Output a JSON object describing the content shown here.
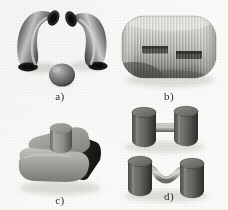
{
  "figure": {
    "background_color": "#fbfaf8",
    "style": "grayscale shaded 3D solid models (CAD render), 2x2 panel layout",
    "panels": [
      {
        "id": "a",
        "caption": "a)",
        "description": "Two mirrored 90-degree pipe elbows (torus bend segments) and one small ellipsoid / sphere below between them",
        "objects": [
          {
            "name": "pipe-elbow-left",
            "shape": "90-degree bent tube",
            "fill": "#5a5a5a",
            "highlight": "#c8c8c8",
            "shadow": "#1e1e1e"
          },
          {
            "name": "pipe-elbow-right",
            "shape": "90-degree bent tube mirrored",
            "fill": "#5a5a5a",
            "highlight": "#cfcfcf",
            "shadow": "#212121"
          },
          {
            "name": "sphere",
            "shape": "ellipsoid",
            "fill": "#7b7b7b",
            "highlight": "#bdbdbd",
            "shadow": "#2e2e2e"
          }
        ]
      },
      {
        "id": "b",
        "caption": "b)",
        "description": "Rounded rectangular block with vertical corrugated ribbing across its face and two dark horizontal pocket slots",
        "objects": [
          {
            "name": "ribbed-block",
            "shape": "rounded box",
            "fill": "#c3c3c0",
            "highlight": "#e6e6e2",
            "shadow": "#3a3a3a",
            "rib_count": 34
          },
          {
            "name": "slot-left",
            "shape": "horizontal rectangular pocket",
            "fill": "#4a4a4a"
          },
          {
            "name": "slot-right",
            "shape": "horizontal rectangular pocket",
            "fill": "#454545"
          }
        ]
      },
      {
        "id": "c",
        "caption": "c)",
        "description": "Rounded-corner slab / pedestal base with a short cylindrical boss standing on its top face",
        "objects": [
          {
            "name": "pedestal-base",
            "shape": "rounded slab",
            "fill": "#9a9a9a",
            "highlight": "#bcbcbc",
            "shadow": "#1c1c1c"
          },
          {
            "name": "cylinder-boss",
            "shape": "cylinder",
            "fill": "#8c8c8c",
            "highlight": "#a8a8a8",
            "shadow": "#4a4a4a"
          }
        ]
      },
      {
        "id": "d",
        "caption": "d)",
        "description": "Two cylinder pairs: the upper pair joined by a straight horizontal rod, the lower pair joined by a wavy S-shaped connector",
        "objects": [
          {
            "name": "cylinder-pair-straight",
            "shape": "two cylinders + straight rod",
            "fill": "#5f5f5f",
            "highlight": "#8e8e8e",
            "shadow": "#2a2a2a"
          },
          {
            "name": "cylinder-pair-wavy",
            "shape": "two cylinders + S-curve rod",
            "fill": "#5f5f5f",
            "highlight": "#9a9a9a",
            "connector_fill": "#b6b6b2"
          }
        ]
      }
    ]
  }
}
